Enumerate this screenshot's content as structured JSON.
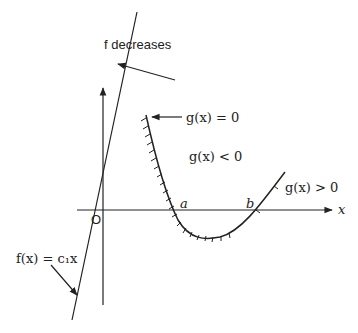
{
  "diagram": {
    "labels": {
      "f_decreases": "f decreases",
      "g_eq_0": "g(x) = 0",
      "g_lt_0": "g(x) < 0",
      "g_gt_0": "g(x) > 0",
      "f_def": "f(x) = c₁x",
      "origin": "O",
      "a": "a",
      "b": "b",
      "x_axis": "x"
    },
    "colors": {
      "stroke": "#222222",
      "background": "#ffffff"
    }
  }
}
